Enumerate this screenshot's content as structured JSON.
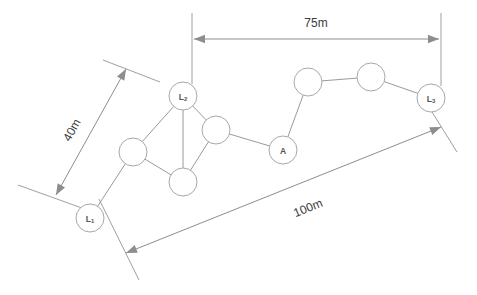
{
  "diagram": {
    "background_color": "#ffffff",
    "line_color": "#9a9a9a",
    "text_color": "#3b3b3b",
    "nodes": [
      {
        "id": "L1",
        "label": "L",
        "sub": "1",
        "x": 90,
        "y": 218,
        "r": 14,
        "type": "anchor"
      },
      {
        "id": "L2",
        "label": "L",
        "sub": "2",
        "x": 183,
        "y": 96,
        "r": 14,
        "type": "anchor"
      },
      {
        "id": "L3",
        "label": "L",
        "sub": "3",
        "x": 431,
        "y": 98,
        "r": 14,
        "type": "anchor"
      },
      {
        "id": "A",
        "label": "A",
        "sub": "",
        "x": 283,
        "y": 150,
        "r": 14,
        "type": "sensor"
      },
      {
        "id": "n1",
        "label": "",
        "sub": "",
        "x": 133,
        "y": 152,
        "r": 14,
        "type": "sensor"
      },
      {
        "id": "n2",
        "label": "",
        "sub": "",
        "x": 183,
        "y": 182,
        "r": 14,
        "type": "sensor"
      },
      {
        "id": "n3",
        "label": "",
        "sub": "",
        "x": 216,
        "y": 130,
        "r": 14,
        "type": "sensor"
      },
      {
        "id": "n4",
        "label": "",
        "sub": "",
        "x": 308,
        "y": 82,
        "r": 14,
        "type": "sensor"
      },
      {
        "id": "n5",
        "label": "",
        "sub": "",
        "x": 371,
        "y": 77,
        "r": 14,
        "type": "sensor"
      }
    ],
    "edges": [
      {
        "from": "L1",
        "to": "n1"
      },
      {
        "from": "n1",
        "to": "L2"
      },
      {
        "from": "n1",
        "to": "n2"
      },
      {
        "from": "n2",
        "to": "L2"
      },
      {
        "from": "n2",
        "to": "n3"
      },
      {
        "from": "L2",
        "to": "n3"
      },
      {
        "from": "n3",
        "to": "A"
      },
      {
        "from": "A",
        "to": "n4"
      },
      {
        "from": "n4",
        "to": "n5"
      },
      {
        "from": "n5",
        "to": "L3"
      }
    ],
    "dimensions": [
      {
        "id": "dim-75m",
        "label": "75m",
        "orientation": "horizontal",
        "line": {
          "x1": 194,
          "y1": 39,
          "x2": 439,
          "y2": 39
        },
        "label_pos": {
          "x": 316,
          "y": 23
        },
        "rotation": 0,
        "extensions": [
          {
            "x1": 192,
            "y1": 13,
            "x2": 192,
            "y2": 84
          },
          {
            "x1": 441,
            "y1": 13,
            "x2": 441,
            "y2": 86
          }
        ]
      },
      {
        "id": "dim-40m",
        "label": "40m",
        "orientation": "diagonal",
        "line": {
          "x1": 56,
          "y1": 195,
          "x2": 126,
          "y2": 69
        },
        "label_pos": {
          "x": 72,
          "y": 130
        },
        "rotation": -61,
        "extensions": [
          {
            "x1": 18,
            "y1": 185,
            "x2": 93,
            "y2": 212
          },
          {
            "x1": 103,
            "y1": 60,
            "x2": 160,
            "y2": 82
          }
        ]
      },
      {
        "id": "dim-100m",
        "label": "100m",
        "orientation": "diagonal",
        "line": {
          "x1": 126,
          "y1": 253,
          "x2": 441,
          "y2": 127
        },
        "label_pos": {
          "x": 308,
          "y": 208
        },
        "rotation": -22,
        "extensions": [
          {
            "x1": 99,
            "y1": 199,
            "x2": 139,
            "y2": 280
          },
          {
            "x1": 427,
            "y1": 104,
            "x2": 457,
            "y2": 152
          }
        ]
      }
    ]
  }
}
